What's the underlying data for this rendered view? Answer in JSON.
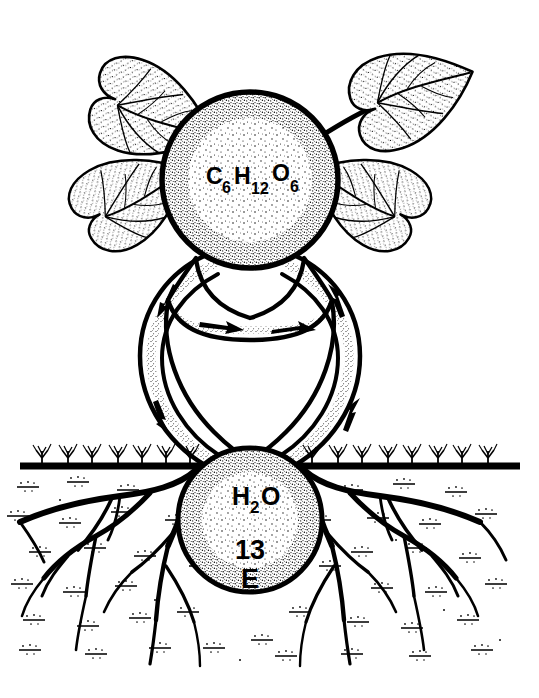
{
  "figure": {
    "background_color": "#ffffff",
    "ink_color": "#000000",
    "style": "black-and-white stippled pen-and-ink line art",
    "width": 539,
    "height": 698
  },
  "labels": {
    "glucose": {
      "name": "glucose-formula",
      "element_c": "C",
      "sub_c": "6",
      "element_h": "H",
      "sub_h": "12",
      "element_o": "O",
      "sub_o": "6",
      "plain": "C6H12O6"
    },
    "water": {
      "name": "water-formula",
      "element_h": "H",
      "sub_h": "2",
      "element_o": "O",
      "plain": "H2O"
    },
    "number": "13",
    "letter": "E"
  },
  "structures": {
    "upper_circle": {
      "name": "glucose-node",
      "cx": 250,
      "cy": 180,
      "r": 88
    },
    "lower_circle": {
      "name": "water-node",
      "cx": 250,
      "cy": 520,
      "r": 72
    },
    "ground_line_y": 466,
    "leaf_count": 4,
    "leaves": [
      {
        "position": "upper-left",
        "label": "leaf-upper-left"
      },
      {
        "position": "upper-right",
        "label": "leaf-upper-right"
      },
      {
        "position": "lower-left",
        "label": "leaf-lower-left"
      },
      {
        "position": "lower-right",
        "label": "leaf-lower-right"
      }
    ],
    "tubes": [
      {
        "name": "outer-tube-loop",
        "description": "outer vascular loop connecting upper and lower nodes"
      },
      {
        "name": "inner-tube-loop",
        "description": "inner vascular loop connecting upper and lower nodes"
      }
    ],
    "arrows": [
      {
        "name": "arrow-outer-left-down",
        "direction": "down"
      },
      {
        "name": "arrow-outer-left-lower-down",
        "direction": "down"
      },
      {
        "name": "arrow-outer-right-up",
        "direction": "up"
      },
      {
        "name": "arrow-outer-right-lower-up",
        "direction": "up"
      },
      {
        "name": "arrow-inner-left-right",
        "direction": "right"
      },
      {
        "name": "arrow-inner-right-right",
        "direction": "right"
      }
    ]
  }
}
